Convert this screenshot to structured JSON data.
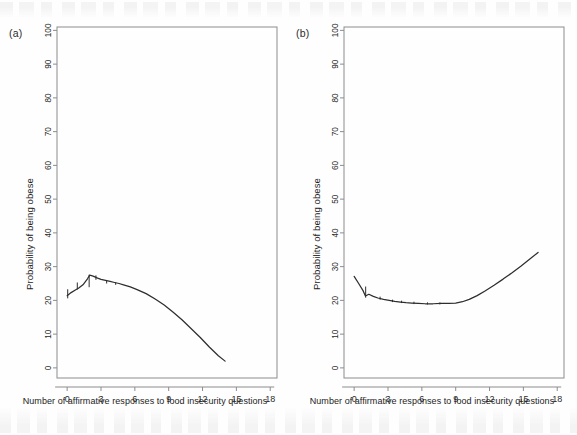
{
  "figure": {
    "panel_a_tag": "(a)",
    "panel_b_tag": "(b)",
    "ylabel": "Probability of being obese",
    "xlabel": "Number of affirmative responses to food insecurity questions",
    "line_color": "#2e2e2e",
    "axis_color": "#8c8c8c"
  },
  "chart_data": [
    {
      "type": "line",
      "panel": "(a)",
      "title": "",
      "xlabel": "Number of affirmative responses to food insecurity questions",
      "ylabel": "Probability of being obese",
      "xlim": [
        -0.9,
        18.6
      ],
      "ylim": [
        -3,
        101
      ],
      "xticks": [
        0,
        3,
        6,
        9,
        12,
        15,
        18
      ],
      "yticks": [
        0,
        10,
        20,
        30,
        40,
        50,
        60,
        70,
        80,
        90,
        100
      ],
      "xticklabels": [
        "0",
        "3",
        "6",
        "9",
        "12",
        "15",
        "18"
      ],
      "yticklabels": [
        "0",
        "10",
        "20",
        "30",
        "40",
        "50",
        "60",
        "70",
        "80",
        "90",
        "100"
      ],
      "grid": false,
      "legend": null,
      "series": [
        {
          "name": "fitted probability",
          "x": [
            0,
            0.35,
            0.8,
            1.0,
            1.4,
            1.8,
            2.0,
            2.3,
            2.7,
            3.0,
            3.4,
            3.8,
            4.2,
            4.6,
            5.0,
            5.6,
            6.2,
            7.0,
            7.8,
            8.6,
            9.4,
            10.2,
            11.0,
            11.8,
            12.6,
            13.4,
            14.0
          ],
          "y": [
            21.4,
            22.3,
            23.2,
            23.6,
            24.6,
            26.4,
            27.5,
            27.2,
            26.6,
            26.2,
            25.9,
            25.6,
            25.3,
            25.0,
            24.6,
            24.0,
            23.2,
            22.0,
            20.4,
            18.6,
            16.5,
            14.2,
            11.6,
            9.0,
            6.2,
            3.6,
            2.0
          ]
        }
      ],
      "error_bars": [
        {
          "x": 0.05,
          "ylow": 20.6,
          "yhigh": 23.3
        },
        {
          "x": 0.9,
          "ylow": 23.2,
          "yhigh": 25.3
        },
        {
          "x": 1.95,
          "ylow": 23.9,
          "yhigh": 27.6
        },
        {
          "x": 2.55,
          "ylow": 26.1,
          "yhigh": 27.4
        },
        {
          "x": 3.5,
          "ylow": 25.0,
          "yhigh": 26.0
        },
        {
          "x": 4.3,
          "ylow": 24.6,
          "yhigh": 25.4
        }
      ]
    },
    {
      "type": "line",
      "panel": "(b)",
      "title": "",
      "xlabel": "Number of affirmative responses to food insecurity questions",
      "ylabel": "Probability of being obese",
      "xlim": [
        -0.9,
        18.6
      ],
      "ylim": [
        -3,
        101
      ],
      "xticks": [
        0,
        3,
        6,
        9,
        12,
        15,
        18
      ],
      "yticks": [
        0,
        10,
        20,
        30,
        40,
        50,
        60,
        70,
        80,
        90,
        100
      ],
      "xticklabels": [
        "0",
        "3",
        "6",
        "9",
        "12",
        "15",
        "18"
      ],
      "yticklabels": [
        "0",
        "10",
        "20",
        "30",
        "40",
        "50",
        "60",
        "70",
        "80",
        "90",
        "100"
      ],
      "grid": false,
      "legend": null,
      "series": [
        {
          "name": "fitted probability",
          "x": [
            0,
            0.4,
            0.8,
            1.0,
            1.3,
            1.7,
            2.1,
            2.6,
            3.1,
            3.6,
            4.1,
            4.6,
            5.1,
            5.7,
            6.3,
            7.0,
            7.7,
            8.4,
            9.0,
            9.6,
            10.2,
            10.9,
            11.6,
            12.4,
            13.2,
            14.0,
            14.8,
            15.6,
            16.3
          ],
          "y": [
            27.1,
            25.0,
            22.8,
            21.3,
            21.8,
            21.2,
            20.7,
            20.3,
            20.0,
            19.7,
            19.5,
            19.3,
            19.2,
            19.1,
            19.0,
            19.0,
            19.1,
            19.1,
            19.2,
            19.6,
            20.3,
            21.4,
            22.8,
            24.5,
            26.3,
            28.2,
            30.2,
            32.3,
            34.2
          ]
        }
      ],
      "error_bars": [
        {
          "x": 1.02,
          "ylow": 20.8,
          "yhigh": 24.1
        },
        {
          "x": 2.3,
          "ylow": 20.2,
          "yhigh": 21.1
        },
        {
          "x": 3.4,
          "ylow": 19.5,
          "yhigh": 20.2
        },
        {
          "x": 4.2,
          "ylow": 19.2,
          "yhigh": 19.9
        },
        {
          "x": 5.3,
          "ylow": 18.9,
          "yhigh": 19.6
        },
        {
          "x": 6.5,
          "ylow": 18.8,
          "yhigh": 19.4
        },
        {
          "x": 7.6,
          "ylow": 18.8,
          "yhigh": 19.4
        }
      ]
    }
  ]
}
